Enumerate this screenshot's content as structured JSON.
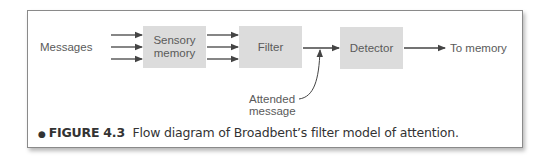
{
  "diagram": {
    "input_label": "Messages",
    "nodes": [
      {
        "id": "sensory",
        "label_line1": "Sensory",
        "label_line2": "memory"
      },
      {
        "id": "filter",
        "label": "Filter"
      },
      {
        "id": "detector",
        "label": "Detector"
      }
    ],
    "output_label": "To memory",
    "attended_label_line1": "Attended",
    "attended_label_line2": "message",
    "colors": {
      "box": "#dcdcdc",
      "text": "#5a5a5a",
      "arrow": "#444444",
      "border": "#8a8a8a"
    }
  },
  "caption": {
    "bullet": "●",
    "figure_number": "FIGURE 4.3",
    "text": "Flow diagram of Broadbent’s filter model of attention."
  }
}
